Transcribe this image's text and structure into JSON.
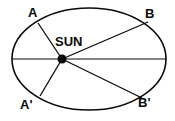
{
  "figure": {
    "type": "orbit-diagram",
    "background_color": "#ffffff",
    "stroke_color": "#0a0a0a",
    "labels": {
      "sun": "SUN",
      "point_a": "A",
      "point_b": "B",
      "point_a_prime": "A'",
      "point_b_prime": "B'"
    }
  },
  "chart_data": {
    "type": "scatter",
    "title": "",
    "xlabel": "",
    "ylabel": "",
    "grid": false,
    "legend": "none",
    "ellipse": {
      "center_x": 89,
      "center_y": 59,
      "radius_x": 77,
      "radius_y": 51
    },
    "focus": {
      "label": "SUN",
      "x": 62,
      "y": 59,
      "marker": "filled-dot",
      "marker_radius": 4.5
    },
    "major_axis": {
      "x1": 12,
      "y1": 59,
      "x2": 166,
      "y2": 59
    },
    "radius_vectors": [
      {
        "name": "A",
        "x": 38,
        "y": 23
      },
      {
        "name": "B",
        "x": 148,
        "y": 22
      },
      {
        "name": "A'",
        "x": 40,
        "y": 96
      },
      {
        "name": "B'",
        "x": 142,
        "y": 98
      }
    ],
    "label_positions": {
      "sun": {
        "x": 55,
        "y": 35
      },
      "point_a": {
        "x": 28,
        "y": 6
      },
      "point_b": {
        "x": 145,
        "y": 7
      },
      "point_a_prime": {
        "x": 20,
        "y": 98
      },
      "point_b_prime": {
        "x": 138,
        "y": 96
      }
    }
  }
}
